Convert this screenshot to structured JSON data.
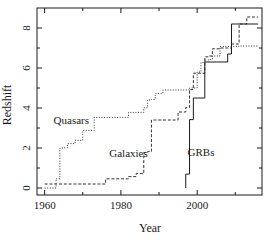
{
  "chart_data": {
    "type": "line",
    "title": "",
    "xlabel": "Year",
    "ylabel": "Redshift",
    "xlim": [
      1958,
      2017
    ],
    "ylim": [
      -0.35,
      9.0
    ],
    "grid": false,
    "legend_position": "inline-annotations",
    "xticks": [
      1960,
      1980,
      2000
    ],
    "xtick_labels": [
      "1960",
      "1980",
      "2000"
    ],
    "xminorticks": [
      1970,
      1990,
      2010
    ],
    "yticks": [
      0,
      2,
      4,
      6,
      8
    ],
    "ytick_labels": [
      "0",
      "2",
      "4",
      "6",
      "8"
    ],
    "yminorticks": [
      1,
      3,
      5,
      7
    ],
    "series": [
      {
        "name": "Quasars",
        "style": "dotted",
        "color": "#333333",
        "label_x": 1967,
        "label_y": 3.2,
        "x": [
          1960,
          1963,
          1963,
          1964,
          1964,
          1965,
          1965,
          1966,
          1966,
          1968,
          1968,
          1970,
          1970,
          1973,
          1973,
          1982,
          1982,
          1986,
          1986,
          1987,
          1987,
          1988,
          1988,
          1989,
          1989,
          1991,
          1991,
          1998,
          1998,
          2000,
          2000,
          2001,
          2001,
          2002,
          2002,
          2003,
          2003,
          2004,
          2004,
          2006,
          2006,
          2011,
          2011,
          2016
        ],
        "y": [
          0.0,
          0.0,
          0.46,
          0.46,
          2.0,
          2.0,
          2.01,
          2.01,
          2.22,
          2.22,
          2.38,
          2.38,
          2.88,
          2.88,
          3.53,
          3.53,
          3.78,
          3.78,
          4.01,
          4.01,
          4.4,
          4.4,
          4.43,
          4.43,
          4.73,
          4.73,
          4.9,
          4.9,
          5.0,
          5.0,
          5.8,
          5.8,
          6.28,
          6.28,
          6.4,
          6.4,
          6.43,
          6.43,
          6.6,
          6.6,
          7.08,
          7.08,
          7.1,
          7.1
        ]
      },
      {
        "name": "Galaxies",
        "style": "dashed",
        "color": "#333333",
        "label_x": 1982,
        "label_y": 1.55,
        "x": [
          1960,
          1976,
          1976,
          1982,
          1982,
          1984,
          1984,
          1986,
          1986,
          1987,
          1987,
          1988,
          1988,
          1995,
          1995,
          1997,
          1997,
          1998,
          1998,
          1999,
          1999,
          2002,
          2002,
          2003,
          2003,
          2004,
          2004,
          2006,
          2006,
          2009,
          2009,
          2011,
          2011,
          2013,
          2013,
          2016
        ],
        "y": [
          0.2,
          0.2,
          0.46,
          0.46,
          0.57,
          0.57,
          0.72,
          0.72,
          1.78,
          1.78,
          1.82,
          1.82,
          3.4,
          3.4,
          3.8,
          3.8,
          4.02,
          4.02,
          4.92,
          4.92,
          5.74,
          5.74,
          6.56,
          6.56,
          6.6,
          6.6,
          6.96,
          6.96,
          7.0,
          7.0,
          7.2,
          7.2,
          8.2,
          8.2,
          8.55,
          8.55
        ]
      },
      {
        "name": "GRBs",
        "style": "solid",
        "color": "#1a1a1a",
        "label_x": 2001,
        "label_y": 1.6,
        "x": [
          1997,
          1997,
          1998,
          1998,
          1999,
          1999,
          2000,
          2000,
          2002,
          2002,
          2005,
          2005,
          2008,
          2008,
          2009,
          2009,
          2010,
          2010,
          2016
        ],
        "y": [
          0.0,
          0.695,
          0.695,
          3.42,
          3.42,
          4.5,
          4.5,
          4.5,
          4.5,
          6.3,
          6.3,
          6.3,
          6.3,
          6.7,
          6.7,
          8.2,
          8.2,
          8.2,
          8.2
        ]
      }
    ]
  }
}
